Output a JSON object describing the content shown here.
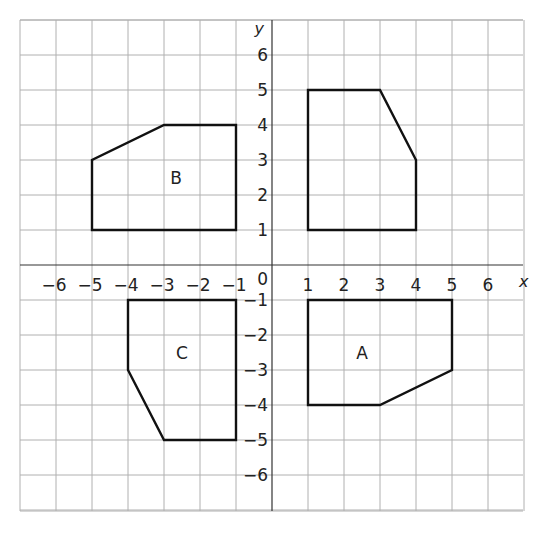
{
  "diagram": {
    "type": "coordinate-grid",
    "x_axis_label": "x",
    "y_axis_label": "y",
    "origin_label": "0",
    "x_range": [
      -7,
      7
    ],
    "y_range": [
      -7,
      7
    ],
    "x_ticks": [
      {
        "v": -6,
        "label": "−6"
      },
      {
        "v": -5,
        "label": "−5"
      },
      {
        "v": -4,
        "label": "−4"
      },
      {
        "v": -3,
        "label": "−3"
      },
      {
        "v": -2,
        "label": "−2"
      },
      {
        "v": -1,
        "label": "−1"
      },
      {
        "v": 1,
        "label": "1"
      },
      {
        "v": 2,
        "label": "2"
      },
      {
        "v": 3,
        "label": "3"
      },
      {
        "v": 4,
        "label": "4"
      },
      {
        "v": 5,
        "label": "5"
      },
      {
        "v": 6,
        "label": "6"
      }
    ],
    "y_ticks": [
      {
        "v": 6,
        "label": "6"
      },
      {
        "v": 5,
        "label": "5"
      },
      {
        "v": 4,
        "label": "4"
      },
      {
        "v": 3,
        "label": "3"
      },
      {
        "v": 2,
        "label": "2"
      },
      {
        "v": 1,
        "label": "1"
      },
      {
        "v": -1,
        "label": "−1"
      },
      {
        "v": -2,
        "label": "−2"
      },
      {
        "v": -3,
        "label": "−3"
      },
      {
        "v": -4,
        "label": "−4"
      },
      {
        "v": -5,
        "label": "−5"
      },
      {
        "v": -6,
        "label": "−6"
      }
    ],
    "shapes": [
      {
        "name": "object",
        "label": "",
        "label_pos": null,
        "points": [
          [
            1,
            1
          ],
          [
            1,
            5
          ],
          [
            3,
            5
          ],
          [
            4,
            3
          ],
          [
            4,
            1
          ]
        ]
      },
      {
        "name": "B",
        "label": "B",
        "label_pos": [
          -2.5,
          2.5
        ],
        "points": [
          [
            -5,
            1
          ],
          [
            -1,
            1
          ],
          [
            -1,
            4
          ],
          [
            -3,
            4
          ],
          [
            -5,
            3
          ]
        ]
      },
      {
        "name": "C",
        "label": "C",
        "label_pos": [
          -2.5,
          -2.5
        ],
        "points": [
          [
            -4,
            -1
          ],
          [
            -1,
            -1
          ],
          [
            -1,
            -5
          ],
          [
            -3,
            -5
          ],
          [
            -4,
            -3
          ]
        ]
      },
      {
        "name": "A",
        "label": "A",
        "label_pos": [
          2.5,
          -2.5
        ],
        "points": [
          [
            1,
            -1
          ],
          [
            5,
            -1
          ],
          [
            5,
            -3
          ],
          [
            3,
            -4
          ],
          [
            1,
            -4
          ]
        ]
      }
    ],
    "colors": {
      "grid": "#b0b0b0",
      "shape": "#111111",
      "text": "#222222"
    }
  }
}
